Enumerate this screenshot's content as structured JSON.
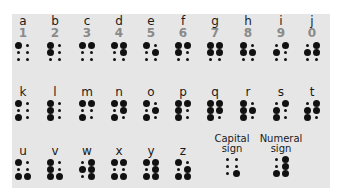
{
  "colors": {
    "background": "#ffffff",
    "panel": "#e6e6e6",
    "dot": "#111111",
    "letter": "#1a1a1a",
    "numeral": "#8a8a8a"
  },
  "legend": "Dots numbered 1-2-3 down the left column, 4-5-6 down the right column",
  "rows": [
    {
      "cells": [
        {
          "letter": "a",
          "numeral": "1",
          "dots": [
            1
          ]
        },
        {
          "letter": "b",
          "numeral": "2",
          "dots": [
            1,
            2
          ]
        },
        {
          "letter": "c",
          "numeral": "3",
          "dots": [
            1,
            4
          ]
        },
        {
          "letter": "d",
          "numeral": "4",
          "dots": [
            1,
            4,
            5
          ]
        },
        {
          "letter": "e",
          "numeral": "5",
          "dots": [
            1,
            5
          ]
        },
        {
          "letter": "f",
          "numeral": "6",
          "dots": [
            1,
            2,
            4
          ]
        },
        {
          "letter": "g",
          "numeral": "7",
          "dots": [
            1,
            2,
            4,
            5
          ]
        },
        {
          "letter": "h",
          "numeral": "8",
          "dots": [
            1,
            2,
            5
          ]
        },
        {
          "letter": "i",
          "numeral": "9",
          "dots": [
            2,
            4
          ]
        },
        {
          "letter": "j",
          "numeral": "0",
          "dots": [
            2,
            4,
            5
          ]
        }
      ]
    },
    {
      "cells": [
        {
          "letter": "k",
          "dots": [
            1,
            3
          ]
        },
        {
          "letter": "l",
          "dots": [
            1,
            2,
            3
          ]
        },
        {
          "letter": "m",
          "dots": [
            1,
            3,
            4
          ]
        },
        {
          "letter": "n",
          "dots": [
            1,
            3,
            4,
            5
          ]
        },
        {
          "letter": "o",
          "dots": [
            1,
            3,
            5
          ]
        },
        {
          "letter": "p",
          "dots": [
            1,
            2,
            3,
            4
          ]
        },
        {
          "letter": "q",
          "dots": [
            1,
            2,
            3,
            4,
            5
          ]
        },
        {
          "letter": "r",
          "dots": [
            1,
            2,
            3,
            5
          ]
        },
        {
          "letter": "s",
          "dots": [
            2,
            3,
            4
          ]
        },
        {
          "letter": "t",
          "dots": [
            2,
            3,
            4,
            5
          ]
        }
      ]
    },
    {
      "cells": [
        {
          "letter": "u",
          "dots": [
            1,
            3,
            6
          ]
        },
        {
          "letter": "v",
          "dots": [
            1,
            2,
            3,
            6
          ]
        },
        {
          "letter": "w",
          "dots": [
            2,
            4,
            5,
            6
          ]
        },
        {
          "letter": "x",
          "dots": [
            1,
            3,
            4,
            6
          ]
        },
        {
          "letter": "y",
          "dots": [
            1,
            3,
            4,
            5,
            6
          ]
        },
        {
          "letter": "z",
          "dots": [
            1,
            3,
            5,
            6
          ]
        },
        {
          "label_line1": "Capital",
          "label_line2": "sign",
          "dots": [
            6
          ]
        },
        {
          "label_line1": "Numeral",
          "label_line2": "sign",
          "dots": [
            3,
            4,
            5,
            6
          ]
        }
      ]
    }
  ]
}
